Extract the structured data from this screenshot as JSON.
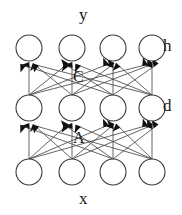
{
  "diagram": {
    "kind": "neural-network-layer-diagram",
    "title_label": "y",
    "bottom_label": "x",
    "layers": [
      {
        "id": "h",
        "side_label": "h",
        "node_count": 4,
        "cy": 48,
        "node_xs": [
          29,
          72,
          113,
          152
        ]
      },
      {
        "id": "d",
        "side_label": "d",
        "node_count": 4,
        "cy": 108,
        "node_xs": [
          29,
          72,
          113,
          152
        ]
      },
      {
        "id": "x",
        "side_label": "",
        "node_count": 4,
        "cy": 172,
        "node_xs": [
          29,
          72,
          113,
          152
        ]
      }
    ],
    "connection_labels": [
      {
        "name": "C",
        "text": "C",
        "between": "d-to-h"
      },
      {
        "name": "A",
        "text": "A",
        "between": "x-to-d"
      }
    ],
    "node_radius": 13,
    "colors": {
      "stroke": "#3a3a3a",
      "arrow_fill": "#111111",
      "node_fill": "#ffffff",
      "background": "#ffffff",
      "text": "#1a1a1a"
    }
  }
}
